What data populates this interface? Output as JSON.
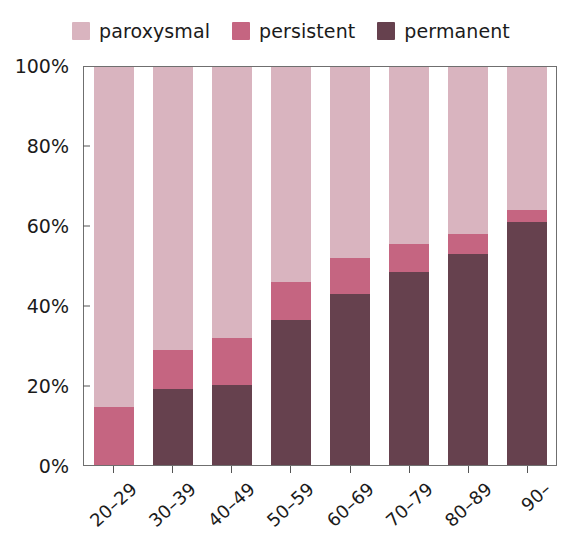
{
  "legend": {
    "position": "top-center",
    "entries": [
      {
        "label": "paroxysmal",
        "color": "#d9b4bf",
        "swatch_name": "legend-swatch-paroxysmal"
      },
      {
        "label": "persistent",
        "color": "#c56581",
        "swatch_name": "legend-swatch-persistent"
      },
      {
        "label": "permanent",
        "color": "#66414e",
        "swatch_name": "legend-swatch-permanent"
      }
    ]
  },
  "axes": {
    "y_ticks": [
      "0%",
      "20%",
      "40%",
      "60%",
      "80%",
      "100%"
    ],
    "y_values": [
      0,
      20,
      40,
      60,
      80,
      100
    ],
    "x_ticks": [
      "20–29",
      "30–39",
      "40–49",
      "50–59",
      "60–69",
      "70–79",
      "80–89",
      "90–"
    ]
  },
  "chart_data": {
    "type": "bar",
    "stacked": true,
    "stack_total": 100,
    "title": "",
    "subtitle": "",
    "xlabel": "",
    "ylabel": "",
    "ylim": [
      0,
      100
    ],
    "grid": false,
    "legend_position": "top-center",
    "categories": [
      "20–29",
      "30–39",
      "40–49",
      "50–59",
      "60–69",
      "70–79",
      "80–89",
      "90–"
    ],
    "series": [
      {
        "name": "permanent",
        "color": "#66414e",
        "values": [
          0,
          19,
          20,
          36.5,
          43,
          48.5,
          53,
          61
        ]
      },
      {
        "name": "persistent",
        "color": "#c56581",
        "values": [
          14.5,
          10,
          12,
          9.5,
          9,
          7,
          5,
          3
        ]
      },
      {
        "name": "paroxysmal",
        "color": "#d9b4bf",
        "values": [
          85.5,
          71,
          68,
          54,
          48,
          44.5,
          42,
          36
        ]
      }
    ],
    "cumulative_tops": {
      "permanent": [
        0,
        19,
        20,
        36.5,
        43,
        48.5,
        53,
        61
      ],
      "persistent": [
        14.5,
        29,
        32,
        46,
        52,
        55.5,
        58,
        64
      ]
    }
  }
}
